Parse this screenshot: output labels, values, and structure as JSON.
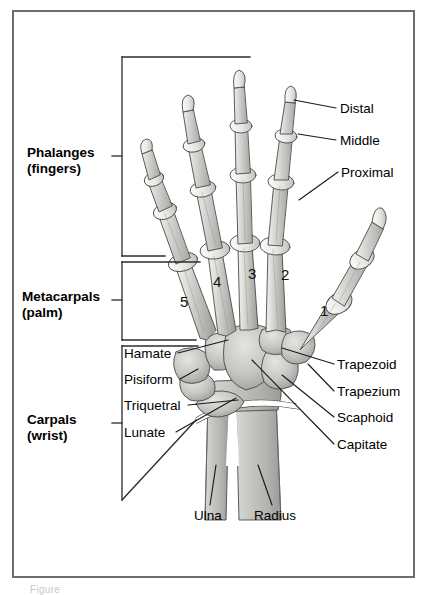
{
  "figure": {
    "border_color": "#6e6e6e",
    "background": "#ffffff",
    "caption": "Figure"
  },
  "group_labels": [
    {
      "id": "phalanges",
      "line1": "Phalanges",
      "line2": "(fingers)"
    },
    {
      "id": "metacarpals",
      "line1": "Metacarpals",
      "line2": "(palm)"
    },
    {
      "id": "carpals",
      "line1": "Carpals",
      "line2": "(wrist)"
    }
  ],
  "right_labels": [
    {
      "id": "distal",
      "text": "Distal"
    },
    {
      "id": "middle",
      "text": "Middle"
    },
    {
      "id": "proximal",
      "text": "Proximal"
    },
    {
      "id": "trapezoid",
      "text": "Trapezoid"
    },
    {
      "id": "trapezium",
      "text": "Trapezium"
    },
    {
      "id": "scaphoid",
      "text": "Scaphoid"
    },
    {
      "id": "capitate",
      "text": "Capitate"
    }
  ],
  "left_labels": [
    {
      "id": "hamate",
      "text": "Hamate"
    },
    {
      "id": "pisiform",
      "text": "Pisiform"
    },
    {
      "id": "triquetral",
      "text": "Triquetral"
    },
    {
      "id": "lunate",
      "text": "Lunate"
    }
  ],
  "bottom_labels": [
    {
      "id": "ulna",
      "text": "Ulna"
    },
    {
      "id": "radius",
      "text": "Radius"
    }
  ],
  "metacarpal_numbers": [
    {
      "id": "mc5",
      "text": "5"
    },
    {
      "id": "mc4",
      "text": "4"
    },
    {
      "id": "mc3",
      "text": "3"
    },
    {
      "id": "mc2",
      "text": "2"
    },
    {
      "id": "mc1",
      "text": "1"
    }
  ],
  "colors": {
    "bone_light": "#e8e8e6",
    "bone_mid": "#c9c9c6",
    "bone_dark": "#9e9e9b",
    "bone_outline": "#4a4a4a",
    "leader_line": "#1a1a1a",
    "bracket": "#2b2b2b"
  }
}
